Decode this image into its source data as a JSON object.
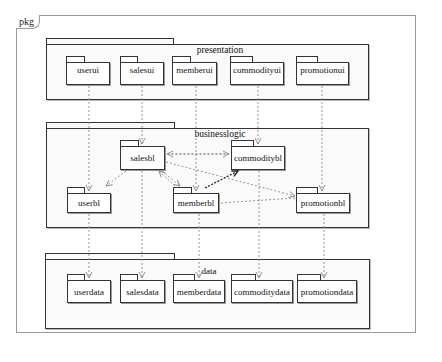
{
  "frame": {
    "label": "pkg"
  },
  "packages": {
    "presentation": {
      "title": "presentation",
      "children": [
        {
          "id": "userui",
          "label": "userui"
        },
        {
          "id": "salesui",
          "label": "salesui"
        },
        {
          "id": "memberui",
          "label": "memberui"
        },
        {
          "id": "commodityui",
          "label": "commodityui"
        },
        {
          "id": "promotionui",
          "label": "promotionui"
        }
      ]
    },
    "businesslogic": {
      "title": "businesslogic",
      "children": [
        {
          "id": "salesbl",
          "label": "salesbl"
        },
        {
          "id": "commoditybl",
          "label": "commoditybl"
        },
        {
          "id": "userbl",
          "label": "userbl"
        },
        {
          "id": "memberbl",
          "label": "memberbl"
        },
        {
          "id": "promotionbl",
          "label": "promotionbl"
        }
      ]
    },
    "data": {
      "title": "data",
      "children": [
        {
          "id": "userdata",
          "label": "userdata"
        },
        {
          "id": "salesdata",
          "label": "salesdata"
        },
        {
          "id": "memberdata",
          "label": "memberdata"
        },
        {
          "id": "commoditydata",
          "label": "commoditydata"
        },
        {
          "id": "promotiondata",
          "label": "promotiondata"
        }
      ]
    }
  },
  "dependencies": [
    {
      "from": "userui",
      "to": "userbl"
    },
    {
      "from": "salesui",
      "to": "salesbl"
    },
    {
      "from": "memberui",
      "to": "memberbl"
    },
    {
      "from": "commodityui",
      "to": "commoditybl"
    },
    {
      "from": "promotionui",
      "to": "promotionbl"
    },
    {
      "from": "salesbl",
      "to": "userbl"
    },
    {
      "from": "salesbl",
      "to": "memberbl"
    },
    {
      "from": "memberbl",
      "to": "salesbl"
    },
    {
      "from": "salesbl",
      "to": "commoditybl"
    },
    {
      "from": "commoditybl",
      "to": "salesbl"
    },
    {
      "from": "salesbl",
      "to": "promotionbl"
    },
    {
      "from": "promotionbl",
      "to": "memberbl"
    },
    {
      "from": "memberbl",
      "to": "commoditybl",
      "style": "bold"
    },
    {
      "from": "userbl",
      "to": "userdata"
    },
    {
      "from": "salesbl",
      "to": "salesdata"
    },
    {
      "from": "memberbl",
      "to": "memberdata"
    },
    {
      "from": "commoditybl",
      "to": "commoditydata"
    },
    {
      "from": "promotionbl",
      "to": "promotiondata"
    }
  ],
  "colors": {
    "line": "#333333",
    "dependency": "#8a8a8a",
    "frame": "#9a9a9a"
  }
}
